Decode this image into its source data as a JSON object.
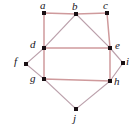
{
  "figure": {
    "width": 132,
    "height": 129,
    "background_color": "#ffffff"
  },
  "colors": {
    "frame_edge": "#cf9a9c",
    "diagonal_edge": "#bba0ab",
    "outer_edge": "#bba0ab",
    "vertex": "#1a1014",
    "label": "#17131a"
  },
  "vertices": [
    {
      "id": "a",
      "label": "a",
      "x": 44,
      "y": 13,
      "label_x": 40,
      "label_y": 0
    },
    {
      "id": "b",
      "label": "b",
      "x": 76,
      "y": 14,
      "label_x": 72,
      "label_y": 1
    },
    {
      "id": "c",
      "label": "c",
      "x": 107,
      "y": 13,
      "label_x": 103,
      "label_y": 0
    },
    {
      "id": "d",
      "label": "d",
      "x": 44,
      "y": 48,
      "label_x": 30,
      "label_y": 39
    },
    {
      "id": "e",
      "label": "e",
      "x": 110,
      "y": 48,
      "label_x": 115,
      "label_y": 40
    },
    {
      "id": "f",
      "label": "f",
      "x": 26,
      "y": 64,
      "label_x": 14,
      "label_y": 56
    },
    {
      "id": "g",
      "label": "g",
      "x": 44,
      "y": 79,
      "label_x": 30,
      "label_y": 73
    },
    {
      "id": "h",
      "label": "h",
      "x": 110,
      "y": 81,
      "label_x": 114,
      "label_y": 76
    },
    {
      "id": "i",
      "label": "i",
      "x": 123,
      "y": 63,
      "label_x": 126,
      "label_y": 56
    },
    {
      "id": "j",
      "label": "j",
      "x": 76,
      "y": 109,
      "label_x": 73,
      "label_y": 113
    }
  ],
  "edges": [
    {
      "from": "a",
      "to": "b",
      "style": "frame"
    },
    {
      "from": "b",
      "to": "c",
      "style": "frame"
    },
    {
      "from": "a",
      "to": "d",
      "style": "frame"
    },
    {
      "from": "d",
      "to": "g",
      "style": "frame"
    },
    {
      "from": "c",
      "to": "e",
      "style": "frame"
    },
    {
      "from": "e",
      "to": "h",
      "style": "frame"
    },
    {
      "from": "g",
      "to": "h",
      "style": "frame"
    },
    {
      "from": "d",
      "to": "e",
      "style": "frame"
    },
    {
      "from": "b",
      "to": "d",
      "style": "diagonal"
    },
    {
      "from": "b",
      "to": "e",
      "style": "diagonal"
    },
    {
      "from": "d",
      "to": "f",
      "style": "outer"
    },
    {
      "from": "f",
      "to": "g",
      "style": "outer"
    },
    {
      "from": "e",
      "to": "i",
      "style": "outer"
    },
    {
      "from": "i",
      "to": "h",
      "style": "outer"
    },
    {
      "from": "g",
      "to": "j",
      "style": "outer"
    },
    {
      "from": "h",
      "to": "j",
      "style": "outer"
    }
  ]
}
